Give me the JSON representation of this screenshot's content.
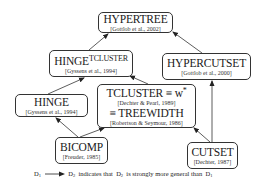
{
  "diagram": {
    "nodes": [
      {
        "id": "hypertree",
        "title": "HYPERTREE",
        "citation": "[Gottlob et al., 2002]"
      },
      {
        "id": "hinge_tcluster",
        "title": "HINGE",
        "superscript": "TCLUSTER",
        "citation": "[Gyssens et al., 1994]"
      },
      {
        "id": "hypercutset",
        "title": "HYPERCUTSET",
        "citation": "[Gottlob et al., 2000]"
      },
      {
        "id": "tcluster",
        "title": "TCLUSTER ≡ w",
        "title_superscript": "*",
        "citation": "[Dechter & Pearl, 1989]",
        "title2": "≡ TREEWIDTH",
        "citation2": "[Robertson & Seymour, 1986]"
      },
      {
        "id": "hinge",
        "title": "HINGE",
        "citation": "[Gyssens et al., 1994]"
      },
      {
        "id": "bicomp",
        "title": "BICOMP",
        "citation": "[Freuder, 1985]"
      },
      {
        "id": "cutset",
        "title": "CUTSET",
        "citation": "[Dechter, 1987]"
      }
    ],
    "edges": [
      {
        "from": "hinge_tcluster",
        "to": "hypertree"
      },
      {
        "from": "hypercutset",
        "to": "hypertree"
      },
      {
        "from": "tcluster",
        "to": "hinge_tcluster"
      },
      {
        "from": "hinge",
        "to": "hinge_tcluster"
      },
      {
        "from": "bicomp",
        "to": "hinge"
      },
      {
        "from": "bicomp",
        "to": "tcluster"
      },
      {
        "from": "cutset",
        "to": "tcluster"
      },
      {
        "from": "cutset",
        "to": "hypercutset"
      }
    ],
    "legend": {
      "d1": "D",
      "d1_sub": "1",
      "d2": "D",
      "d2_sub": "2",
      "text1": " indicates that ",
      "d2b": "D",
      "d2b_sub": "2",
      "text2": " is strongly more general than ",
      "d1b": "D",
      "d1b_sub": "1"
    }
  }
}
